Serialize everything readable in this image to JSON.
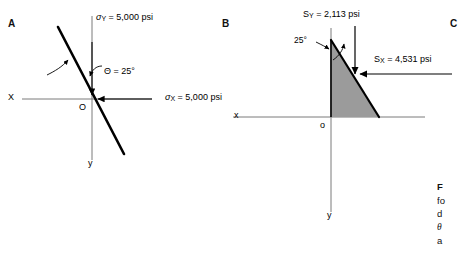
{
  "figure": {
    "panels": [
      {
        "letter": "A",
        "axis_x_label": "X",
        "axis_y_label": "y",
        "origin_label": "O",
        "sigma_y_label": "σ",
        "sigma_y_sub": "Y",
        "sigma_y_value": " = 5,000 psi",
        "sigma_x_label": "σ",
        "sigma_x_sub": "X",
        "sigma_x_value": " = 5,000 psi",
        "theta_label": "Θ = 25°"
      },
      {
        "letter": "B",
        "axis_x_label": "x",
        "axis_y_label": "y",
        "origin_label": "o",
        "s_y_label": "S",
        "s_y_sub": "Y",
        "s_y_value": " = 2,113 psi",
        "s_x_label": "S",
        "s_x_sub": "X",
        "s_x_value": " = 4,531 psi",
        "angle_label": "25°"
      },
      {
        "letter": "C"
      }
    ],
    "caption_lines": [
      "F",
      "fo",
      "d",
      "θ",
      "a"
    ],
    "colors": {
      "shade": "#9b9b9b",
      "axis": "#6b6b6b",
      "stroke": "#000000"
    }
  }
}
